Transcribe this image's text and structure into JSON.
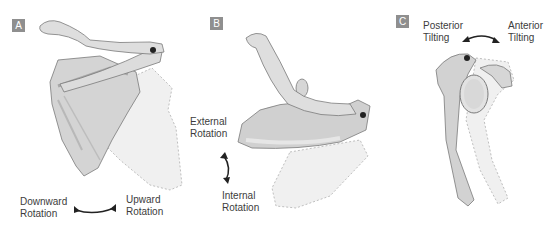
{
  "diagram": {
    "panels": [
      {
        "id": "A",
        "badge": "A",
        "motion_labels": [
          "Downward Rotation",
          "Upward Rotation"
        ],
        "left_label": {
          "line1": "Downward",
          "line2": "Rotation"
        },
        "right_label": {
          "line1": "Upward",
          "line2": "Rotation"
        }
      },
      {
        "id": "B",
        "badge": "B",
        "motion_labels": [
          "External Rotation",
          "Internal Rotation"
        ],
        "top_label": {
          "line1": "External",
          "line2": "Rotation"
        },
        "bottom_label": {
          "line1": "Internal",
          "line2": "Rotation"
        }
      },
      {
        "id": "C",
        "badge": "C",
        "motion_labels": [
          "Posterior Tilting",
          "Anterior Tilting"
        ],
        "left_label": {
          "line1": "Posterior",
          "line2": "Tilting"
        },
        "right_label": {
          "line1": "Anterior",
          "line2": "Tilting"
        }
      }
    ],
    "colors": {
      "badge": "#8f8f8f",
      "bone_fill": "#d4d4d4",
      "bone_shadow": "#a8a8a8",
      "bone_outline": "#7a7a7a",
      "ghost_fill": "#f0f0f0",
      "ghost_outline": "#b0b0b0",
      "pivot_dot": "#222222",
      "arrow": "#222222",
      "text": "#3c3c3c"
    }
  }
}
